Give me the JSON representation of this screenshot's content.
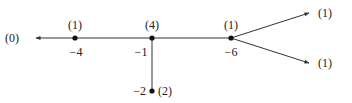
{
  "diagram": {
    "type": "graph",
    "colors": {
      "line": "#333333",
      "text": "#222222",
      "node": "#111111"
    },
    "nodes": [
      {
        "id": "n-4",
        "value": "−4",
        "weight": "(1)",
        "x": 75,
        "y": 38
      },
      {
        "id": "n-1",
        "value": "−1",
        "weight": "(4)",
        "x": 152,
        "y": 38
      },
      {
        "id": "n-6",
        "value": "−6",
        "weight": "(1)",
        "x": 231,
        "y": 38
      },
      {
        "id": "n-2",
        "value": "−2",
        "weight": "(2)",
        "x": 152,
        "y": 91
      }
    ],
    "rays": [
      {
        "id": "left",
        "weight": "(0)"
      },
      {
        "id": "upper-right",
        "weight": "(1)"
      },
      {
        "id": "lower-right",
        "weight": "(1)"
      }
    ]
  }
}
